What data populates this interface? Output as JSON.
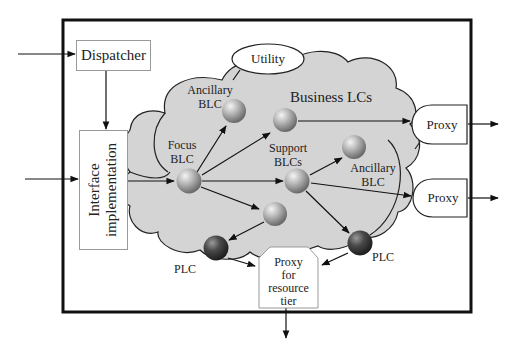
{
  "diagram": {
    "frame": {
      "label": ""
    },
    "dispatcher": {
      "label": "Dispatcher"
    },
    "interface": {
      "label_line1": "Interface",
      "label_line2": "implementation"
    },
    "utility": {
      "label": "Utility"
    },
    "cloud": {
      "label": "Business LCs",
      "fill": "#d4d4d4"
    },
    "nodes": {
      "ancillary_top": {
        "line1": "Ancillary",
        "line2": "BLC"
      },
      "focus": {
        "line1": "Focus",
        "line2": "BLC"
      },
      "support": {
        "line1": "Support",
        "line2": "BLCs"
      },
      "ancillary_right": {
        "line1": "Ancillary",
        "line2": "BLC"
      },
      "plc_left": {
        "label": "PLC"
      },
      "plc_right": {
        "label": "PLC"
      }
    },
    "proxy_top": {
      "label": "Proxy"
    },
    "proxy_mid": {
      "label": "Proxy"
    },
    "proxy_resource": {
      "line1": "Proxy",
      "line2": "for",
      "line3": "resource",
      "line4": "tier"
    },
    "colors": {
      "sphere_light": "#bdbdbd",
      "sphere_dark": "#4a4a4a",
      "line": "#111111"
    }
  }
}
